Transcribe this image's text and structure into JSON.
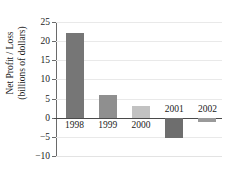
{
  "chart_data": {
    "type": "bar",
    "title": "",
    "xlabel": "",
    "ylabel": "Net Profit / Loss (billions of dollars)",
    "ylabel_line1": "Net Profit / Loss",
    "ylabel_line2": "(billions of dollars)",
    "categories": [
      "1998",
      "1999",
      "2000",
      "2001",
      "2002"
    ],
    "values": [
      22,
      6,
      3,
      -5.3,
      -1
    ],
    "bar_colors": [
      "#767676",
      "#8f8f8f",
      "#c2c2c2",
      "#6e6e6e",
      "#9a9a9a"
    ],
    "ylim": [
      -10,
      25
    ],
    "yticks": [
      25,
      20,
      15,
      10,
      5,
      0,
      -5,
      -10
    ],
    "ytick_labels": [
      "25",
      "20",
      "15",
      "10",
      "5",
      "0",
      "−5",
      "−10"
    ],
    "grid": true,
    "legend": "none",
    "zero_line_color": "#4a4a4a",
    "gridline_color": "#e9e9e9",
    "text_color": "#1b1b1b"
  }
}
